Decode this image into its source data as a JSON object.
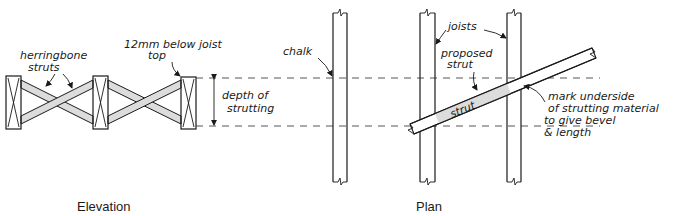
{
  "colors": {
    "ink": "#1a1a1a",
    "strut_fill": "#dcdcdc",
    "background": "#ffffff"
  },
  "elevation": {
    "caption": "Elevation",
    "labels": {
      "herringbone_1": "herringbone",
      "herringbone_2": "struts",
      "below_top_1": "12mm below joist",
      "below_top_2": "top",
      "depth_1": "depth of",
      "depth_2": "strutting"
    }
  },
  "plan": {
    "caption": "Plan",
    "labels": {
      "chalk": "chalk",
      "joists": "joists",
      "proposed_1": "proposed",
      "proposed_2": "strut",
      "strut": "strut",
      "mark_1": "mark underside",
      "mark_2": "of strutting material",
      "mark_3": "to give bevel",
      "mark_4": "& length"
    }
  }
}
